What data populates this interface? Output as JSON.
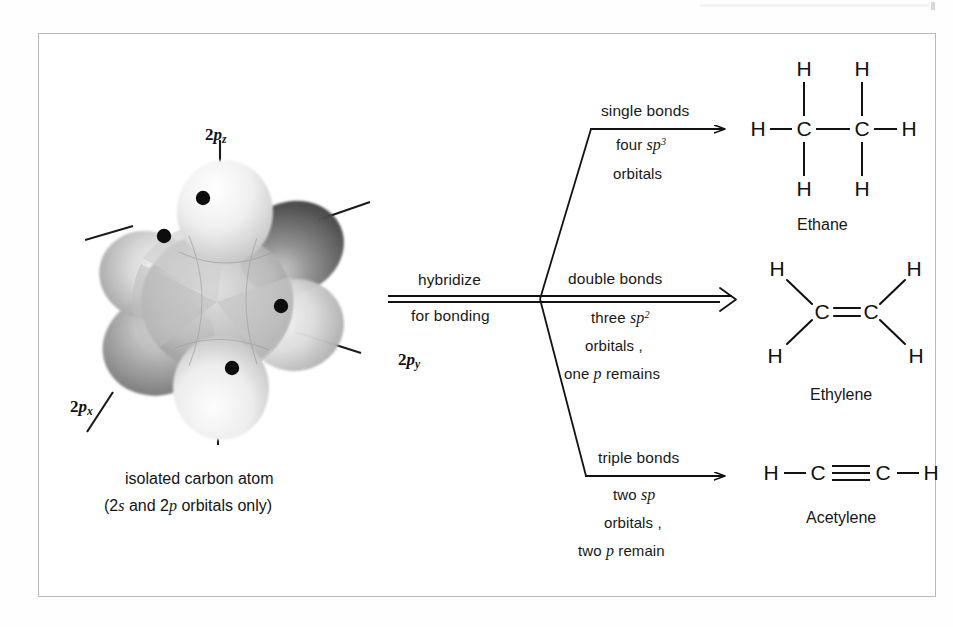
{
  "figure": {
    "type": "chemistry-diagram"
  },
  "orbital_model": {
    "caption_line1": "isolated carbon atom",
    "caption_line2_pre": "(2",
    "caption_line2_s": "s",
    "caption_line2_mid": " and 2",
    "caption_line2_p": "p",
    "caption_line2_post": " orbitals only)",
    "axis_labels": [
      {
        "name": "2p-z",
        "prefix": "2",
        "italic": "p",
        "sub": "z"
      },
      {
        "name": "2p-x",
        "prefix": "2",
        "italic": "p",
        "sub": "x"
      },
      {
        "name": "2p-y",
        "prefix": "2",
        "italic": "p",
        "sub": "y"
      }
    ],
    "electron_dot_count": 4
  },
  "process_arrow": {
    "label_above": "hybridize",
    "label_below": "for bonding",
    "style": "double-line"
  },
  "branches": [
    {
      "id": "single",
      "bond_label": "single bonds",
      "detail_line1_pre": "four ",
      "detail_line1_italic": "sp",
      "detail_line1_sup": "3",
      "detail_line2": "orbitals",
      "detail_line3": "",
      "detail_line3_italic": "",
      "detail_line3_post": ""
    },
    {
      "id": "double",
      "bond_label": "double bonds",
      "detail_line1_pre": "three  ",
      "detail_line1_italic": "sp",
      "detail_line1_sup": "2",
      "detail_line2": "orbitals ,",
      "detail_line3": "one ",
      "detail_line3_italic": "p",
      "detail_line3_post": " remains"
    },
    {
      "id": "triple",
      "bond_label": "triple bonds",
      "detail_line1_pre": "two ",
      "detail_line1_italic": "sp",
      "detail_line1_sup": "",
      "detail_line2": "orbitals ,",
      "detail_line3": "two ",
      "detail_line3_italic": "p",
      "detail_line3_post": " remain"
    }
  ],
  "molecules": [
    {
      "id": "ethane",
      "name": "Ethane",
      "formula_atoms": [
        "H",
        "H",
        "H",
        "C",
        "C",
        "H",
        "H",
        "H"
      ],
      "bond_order": "single",
      "atoms": {
        "h_top_left": "H",
        "h_top_right": "H",
        "h_left": "H",
        "c_left": "C",
        "c_right": "C",
        "h_right": "H",
        "h_bot_left": "H",
        "h_bot_right": "H"
      }
    },
    {
      "id": "ethylene",
      "name": "Ethylene",
      "formula_atoms": [
        "H",
        "H",
        "C",
        "C",
        "H",
        "H"
      ],
      "bond_order": "double",
      "atoms": {
        "h_upper_left": "H",
        "h_upper_right": "H",
        "c_left": "C",
        "c_right": "C",
        "h_lower_left": "H",
        "h_lower_right": "H"
      }
    },
    {
      "id": "acetylene",
      "name": "Acetylene",
      "formula_atoms": [
        "H",
        "C",
        "C",
        "H"
      ],
      "bond_order": "triple",
      "atoms": {
        "h_left": "H",
        "c_left": "C",
        "c_right": "C",
        "h_right": "H"
      }
    }
  ],
  "colors": {
    "ink": "#121212",
    "frame": "#b9b9b9",
    "paper": "#ffffff",
    "orbital_light": "#f2f2f2",
    "orbital_mid": "#b6b6b6",
    "orbital_dark": "#5d5d5d"
  }
}
